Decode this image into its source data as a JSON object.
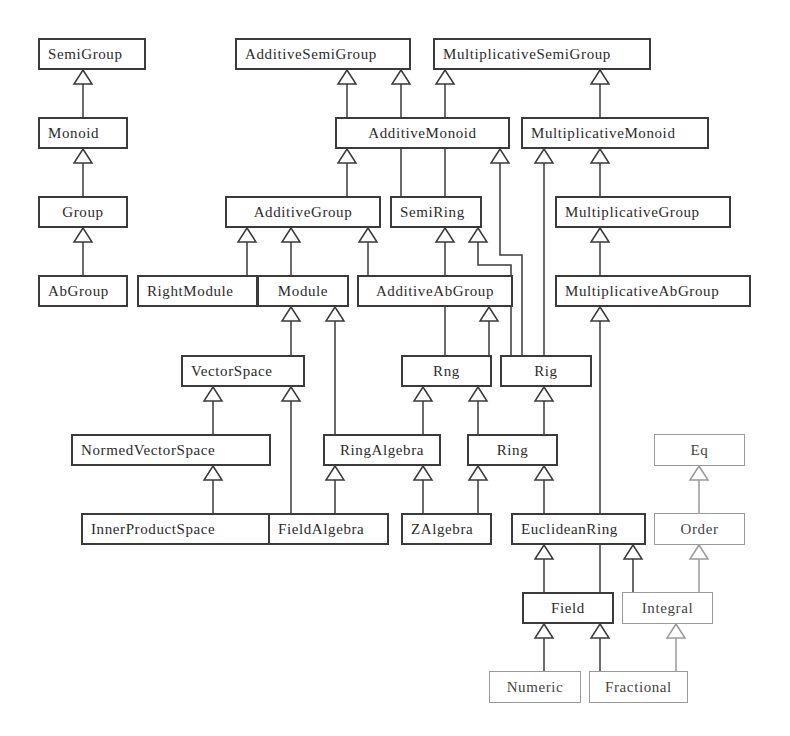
{
  "diagram": {
    "type": "class-hierarchy",
    "colors": {
      "line": "#3a3a3a",
      "light_line": "#9a9a9a",
      "background": "#ffffff"
    },
    "nodes": [
      {
        "id": "SemiGroup",
        "label": "SemiGroup",
        "x": 38,
        "y": 38,
        "w": 108,
        "h": 32,
        "style": "solid",
        "align": "left"
      },
      {
        "id": "Monoid",
        "label": "Monoid",
        "x": 38,
        "y": 117,
        "w": 90,
        "h": 32,
        "style": "solid",
        "align": "left"
      },
      {
        "id": "Group",
        "label": "Group",
        "x": 38,
        "y": 196,
        "w": 90,
        "h": 32,
        "style": "solid",
        "align": "center"
      },
      {
        "id": "AbGroup",
        "label": "AbGroup",
        "x": 38,
        "y": 275,
        "w": 90,
        "h": 32,
        "style": "solid",
        "align": "left"
      },
      {
        "id": "AdditiveSemiGroup",
        "label": "AdditiveSemiGroup",
        "x": 235,
        "y": 38,
        "w": 176,
        "h": 32,
        "style": "solid",
        "align": "left"
      },
      {
        "id": "MultiplicativeSemiGroup",
        "label": "MultiplicativeSemiGroup",
        "x": 433,
        "y": 38,
        "w": 218,
        "h": 32,
        "style": "solid",
        "align": "left"
      },
      {
        "id": "AdditiveMonoid",
        "label": "AdditiveMonoid",
        "x": 335,
        "y": 117,
        "w": 175,
        "h": 32,
        "style": "solid",
        "align": "center"
      },
      {
        "id": "MultiplicativeMonoid",
        "label": "MultiplicativeMonoid",
        "x": 521,
        "y": 117,
        "w": 188,
        "h": 32,
        "style": "solid",
        "align": "left"
      },
      {
        "id": "AdditiveGroup",
        "label": "AdditiveGroup",
        "x": 225,
        "y": 196,
        "w": 156,
        "h": 32,
        "style": "solid",
        "align": "center"
      },
      {
        "id": "SemiRing",
        "label": "SemiRing",
        "x": 390,
        "y": 196,
        "w": 92,
        "h": 32,
        "style": "solid",
        "align": "left"
      },
      {
        "id": "MultiplicativeGroup",
        "label": "MultiplicativeGroup",
        "x": 555,
        "y": 196,
        "w": 176,
        "h": 32,
        "style": "solid",
        "align": "left"
      },
      {
        "id": "RightModule",
        "label": "RightModule",
        "x": 137,
        "y": 275,
        "w": 121,
        "h": 32,
        "style": "solid",
        "align": "left"
      },
      {
        "id": "Module",
        "label": "Module",
        "x": 257,
        "y": 275,
        "w": 92,
        "h": 32,
        "style": "solid",
        "align": "center"
      },
      {
        "id": "AdditiveAbGroup",
        "label": "AdditiveAbGroup",
        "x": 357,
        "y": 275,
        "w": 156,
        "h": 32,
        "style": "solid",
        "align": "center"
      },
      {
        "id": "MultiplicativeAbGroup",
        "label": "MultiplicativeAbGroup",
        "x": 555,
        "y": 275,
        "w": 196,
        "h": 32,
        "style": "solid",
        "align": "left"
      },
      {
        "id": "VectorSpace",
        "label": "VectorSpace",
        "x": 181,
        "y": 355,
        "w": 124,
        "h": 32,
        "style": "solid",
        "align": "left"
      },
      {
        "id": "Rng",
        "label": "Rng",
        "x": 401,
        "y": 355,
        "w": 91,
        "h": 32,
        "style": "solid",
        "align": "center"
      },
      {
        "id": "Rig",
        "label": "Rig",
        "x": 500,
        "y": 355,
        "w": 92,
        "h": 32,
        "style": "solid",
        "align": "center"
      },
      {
        "id": "NormedVectorSpace",
        "label": "NormedVectorSpace",
        "x": 71,
        "y": 434,
        "w": 200,
        "h": 32,
        "style": "solid",
        "align": "left"
      },
      {
        "id": "RingAlgebra",
        "label": "RingAlgebra",
        "x": 323,
        "y": 434,
        "w": 118,
        "h": 32,
        "style": "solid",
        "align": "center"
      },
      {
        "id": "Ring",
        "label": "Ring",
        "x": 467,
        "y": 434,
        "w": 91,
        "h": 32,
        "style": "solid",
        "align": "center"
      },
      {
        "id": "Eq",
        "label": "Eq",
        "x": 654,
        "y": 434,
        "w": 91,
        "h": 32,
        "style": "light",
        "align": "center"
      },
      {
        "id": "InnerProductSpace",
        "label": "InnerProductSpace",
        "x": 81,
        "y": 513,
        "w": 190,
        "h": 32,
        "style": "solid",
        "align": "left"
      },
      {
        "id": "FieldAlgebra",
        "label": "FieldAlgebra",
        "x": 268,
        "y": 513,
        "w": 121,
        "h": 32,
        "style": "solid",
        "align": "left"
      },
      {
        "id": "ZAlgebra",
        "label": "ZAlgebra",
        "x": 401,
        "y": 513,
        "w": 91,
        "h": 32,
        "style": "solid",
        "align": "left"
      },
      {
        "id": "EuclideanRing",
        "label": "EuclideanRing",
        "x": 511,
        "y": 513,
        "w": 135,
        "h": 32,
        "style": "solid",
        "align": "left"
      },
      {
        "id": "Order",
        "label": "Order",
        "x": 654,
        "y": 513,
        "w": 91,
        "h": 32,
        "style": "light",
        "align": "center"
      },
      {
        "id": "Field",
        "label": "Field",
        "x": 522,
        "y": 592,
        "w": 92,
        "h": 32,
        "style": "solid",
        "align": "center"
      },
      {
        "id": "Integral",
        "label": "Integral",
        "x": 622,
        "y": 592,
        "w": 91,
        "h": 32,
        "style": "light",
        "align": "center"
      },
      {
        "id": "Numeric",
        "label": "Numeric",
        "x": 489,
        "y": 671,
        "w": 92,
        "h": 32,
        "style": "light",
        "align": "center"
      },
      {
        "id": "Fractional",
        "label": "Fractional",
        "x": 589,
        "y": 671,
        "w": 99,
        "h": 32,
        "style": "light",
        "align": "center"
      }
    ],
    "edges": [
      {
        "from": "Monoid",
        "to": "SemiGroup",
        "points": [
          [
            83,
            117
          ],
          [
            83,
            70
          ]
        ]
      },
      {
        "from": "Group",
        "to": "Monoid",
        "points": [
          [
            83,
            196
          ],
          [
            83,
            149
          ]
        ]
      },
      {
        "from": "AbGroup",
        "to": "Group",
        "points": [
          [
            83,
            275
          ],
          [
            83,
            228
          ]
        ]
      },
      {
        "from": "AdditiveMonoid",
        "to": "AdditiveSemiGroup",
        "points": [
          [
            347,
            117
          ],
          [
            347,
            70
          ]
        ]
      },
      {
        "from": "SemiRing",
        "to": "AdditiveSemiGroup",
        "points": [
          [
            401,
            196
          ],
          [
            401,
            70
          ]
        ]
      },
      {
        "from": "SemiRing",
        "to": "MultiplicativeSemiGroup",
        "points": [
          [
            445,
            196
          ],
          [
            445,
            70
          ]
        ]
      },
      {
        "from": "MultiplicativeMonoid",
        "to": "MultiplicativeSemiGroup",
        "points": [
          [
            600,
            117
          ],
          [
            600,
            70
          ]
        ]
      },
      {
        "from": "AdditiveGroup",
        "to": "AdditiveMonoid",
        "points": [
          [
            347,
            196
          ],
          [
            347,
            149
          ]
        ]
      },
      {
        "from": "Rig",
        "to": "AdditiveMonoid",
        "points": [
          [
            522,
            355
          ],
          [
            522,
            255
          ],
          [
            500,
            255
          ],
          [
            500,
            149
          ]
        ]
      },
      {
        "from": "Rig",
        "to": "MultiplicativeMonoid",
        "points": [
          [
            544,
            355
          ],
          [
            544,
            149
          ]
        ]
      },
      {
        "from": "MultiplicativeGroup",
        "to": "MultiplicativeMonoid",
        "points": [
          [
            600,
            196
          ],
          [
            600,
            149
          ]
        ]
      },
      {
        "from": "RightModule",
        "to": "AdditiveGroup",
        "points": [
          [
            247,
            275
          ],
          [
            247,
            228
          ]
        ]
      },
      {
        "from": "Module",
        "to": "AdditiveGroup",
        "points": [
          [
            291,
            275
          ],
          [
            291,
            228
          ]
        ]
      },
      {
        "from": "AdditiveAbGroup",
        "to": "AdditiveGroup",
        "points": [
          [
            368,
            275
          ],
          [
            368,
            228
          ]
        ]
      },
      {
        "from": "Rng",
        "to": "SemiRing",
        "points": [
          [
            445,
            355
          ],
          [
            445,
            228
          ]
        ]
      },
      {
        "from": "Rig",
        "to": "SemiRing",
        "points": [
          [
            511,
            355
          ],
          [
            511,
            265
          ],
          [
            478,
            265
          ],
          [
            478,
            228
          ]
        ]
      },
      {
        "from": "MultiplicativeAbGroup",
        "to": "MultiplicativeGroup",
        "points": [
          [
            600,
            275
          ],
          [
            600,
            228
          ]
        ]
      },
      {
        "from": "VectorSpace",
        "to": "Module",
        "points": [
          [
            291,
            355
          ],
          [
            291,
            307
          ]
        ]
      },
      {
        "from": "RingAlgebra",
        "to": "Module",
        "points": [
          [
            335,
            434
          ],
          [
            335,
            307
          ]
        ]
      },
      {
        "from": "Rng",
        "to": "AdditiveAbGroup",
        "points": [
          [
            489,
            355
          ],
          [
            489,
            307
          ]
        ]
      },
      {
        "from": "Field",
        "to": "MultiplicativeAbGroup",
        "points": [
          [
            600,
            592
          ],
          [
            600,
            307
          ]
        ]
      },
      {
        "from": "NormedVectorSpace",
        "to": "VectorSpace",
        "points": [
          [
            213,
            434
          ],
          [
            213,
            387
          ]
        ]
      },
      {
        "from": "FieldAlgebra",
        "to": "VectorSpace",
        "points": [
          [
            291,
            513
          ],
          [
            291,
            387
          ]
        ]
      },
      {
        "from": "RingAlgebra",
        "to": "Rng",
        "points": [
          [
            423,
            434
          ],
          [
            423,
            387
          ]
        ]
      },
      {
        "from": "Ring",
        "to": "Rng",
        "points": [
          [
            478,
            434
          ],
          [
            478,
            387
          ]
        ]
      },
      {
        "from": "Ring",
        "to": "Rig",
        "points": [
          [
            544,
            434
          ],
          [
            544,
            387
          ]
        ]
      },
      {
        "from": "InnerProductSpace",
        "to": "NormedVectorSpace",
        "points": [
          [
            213,
            513
          ],
          [
            213,
            466
          ]
        ]
      },
      {
        "from": "FieldAlgebra",
        "to": "RingAlgebra",
        "points": [
          [
            335,
            513
          ],
          [
            335,
            466
          ]
        ]
      },
      {
        "from": "ZAlgebra",
        "to": "RingAlgebra",
        "points": [
          [
            423,
            513
          ],
          [
            423,
            466
          ]
        ]
      },
      {
        "from": "ZAlgebra",
        "to": "Ring",
        "points": [
          [
            478,
            513
          ],
          [
            478,
            466
          ]
        ]
      },
      {
        "from": "EuclideanRing",
        "to": "Ring",
        "points": [
          [
            544,
            513
          ],
          [
            544,
            466
          ]
        ]
      },
      {
        "from": "Order",
        "to": "Eq",
        "points": [
          [
            699,
            513
          ],
          [
            699,
            466
          ]
        ],
        "style": "light"
      },
      {
        "from": "Field",
        "to": "EuclideanRing",
        "points": [
          [
            544,
            592
          ],
          [
            544,
            545
          ]
        ]
      },
      {
        "from": "Integral",
        "to": "EuclideanRing",
        "points": [
          [
            633,
            592
          ],
          [
            633,
            545
          ]
        ]
      },
      {
        "from": "Integral",
        "to": "Order",
        "points": [
          [
            699,
            592
          ],
          [
            699,
            545
          ]
        ],
        "style": "light"
      },
      {
        "from": "Numeric",
        "to": "Field",
        "points": [
          [
            544,
            671
          ],
          [
            544,
            624
          ]
        ]
      },
      {
        "from": "Fractional",
        "to": "Field",
        "points": [
          [
            600,
            671
          ],
          [
            600,
            624
          ]
        ]
      },
      {
        "from": "Fractional",
        "to": "Integral",
        "points": [
          [
            676,
            671
          ],
          [
            676,
            624
          ]
        ],
        "style": "light"
      }
    ]
  }
}
